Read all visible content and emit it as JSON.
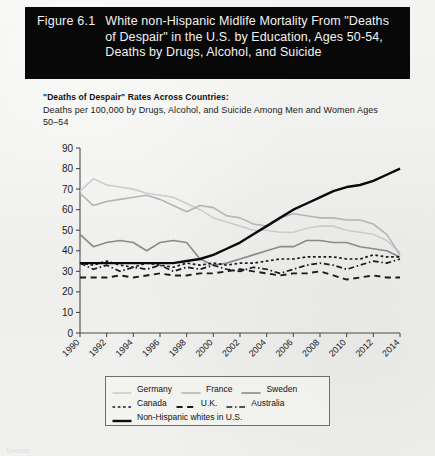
{
  "figure": {
    "number": "Figure 6.1",
    "title": "White non-Hispanic Midlife Mortality From \"Deaths of Despair\" in the U.S. by Education, Ages 50-54, Deaths by Drugs, Alcohol, and Suicide"
  },
  "footer": {
    "note": "Source:"
  },
  "colors": {
    "banner_bg": "#080808",
    "banner_text": "#f2f2f2",
    "page_bg": "#f1f1ef",
    "germany": "#cccccc",
    "france": "#b4b4b4",
    "sweden": "#8a8a8a",
    "canada": "#1a1a1a",
    "uk": "#1a1a1a",
    "australia": "#1a1a1a",
    "us_whites": "#0a0a0a",
    "axis": "#4a4a4a",
    "legend_border": "#6e6e6e"
  },
  "chart_data": {
    "type": "line",
    "title": "\"Deaths of Despair\" Rates Across Countries:",
    "subtitle": "Deaths per 100,000 by Drugs, Alcohol, and Suicide Among Men and Women Ages 50–54",
    "xlabel": "",
    "ylabel": "",
    "xlim": [
      1990,
      2014
    ],
    "ylim": [
      0,
      90
    ],
    "grid": false,
    "legend_position": "bottom",
    "x": [
      1990,
      1991,
      1992,
      1993,
      1994,
      1995,
      1996,
      1997,
      1998,
      1999,
      2000,
      2001,
      2002,
      2003,
      2004,
      2005,
      2006,
      2007,
      2008,
      2009,
      2010,
      2011,
      2012,
      2013,
      2014
    ],
    "xticks": [
      "1990",
      "1992",
      "1994",
      "1996",
      "1998",
      "2000",
      "2002",
      "2004",
      "2006",
      "2008",
      "2010",
      "2012",
      "2014"
    ],
    "yticks": [
      "0",
      "10",
      "20",
      "30",
      "40",
      "50",
      "60",
      "70",
      "80",
      "90"
    ],
    "series": [
      {
        "name": "Germany",
        "style": "solid",
        "color": "#cccccc",
        "width": 1.6,
        "values": [
          69,
          75,
          72,
          71,
          70,
          68,
          67,
          66,
          63,
          60,
          56,
          54,
          52,
          50,
          50,
          49,
          49,
          51,
          52,
          52,
          50,
          49,
          48,
          45,
          39
        ]
      },
      {
        "name": "France",
        "style": "solid",
        "color": "#b4b4b4",
        "width": 1.6,
        "values": [
          68,
          62,
          64,
          65,
          66,
          67,
          65,
          62,
          59,
          62,
          61,
          57,
          56,
          53,
          52,
          56,
          58,
          57,
          56,
          56,
          55,
          55,
          53,
          48,
          38
        ]
      },
      {
        "name": "Sweden",
        "style": "solid",
        "color": "#8a8a8a",
        "width": 1.6,
        "values": [
          48,
          42,
          44,
          45,
          44,
          40,
          44,
          45,
          44,
          36,
          33,
          34,
          36,
          38,
          40,
          42,
          42,
          45,
          45,
          44,
          44,
          42,
          41,
          40,
          37
        ]
      },
      {
        "name": "Canada",
        "style": "dotted",
        "color": "#1a1a1a",
        "width": 1.7,
        "values": [
          34,
          33,
          35,
          33,
          32,
          34,
          33,
          32,
          34,
          33,
          34,
          33,
          34,
          34,
          35,
          36,
          36,
          37,
          37,
          37,
          36,
          36,
          38,
          37,
          37
        ]
      },
      {
        "name": "U.K.",
        "style": "dashed",
        "color": "#1a1a1a",
        "width": 1.9,
        "values": [
          27,
          27,
          27,
          28,
          27,
          28,
          29,
          28,
          28,
          29,
          29,
          30,
          31,
          30,
          29,
          28,
          29,
          29,
          30,
          28,
          26,
          27,
          28,
          27,
          27
        ]
      },
      {
        "name": "Australia",
        "style": "dashdot",
        "color": "#1a1a1a",
        "width": 1.7,
        "values": [
          34,
          31,
          33,
          30,
          32,
          31,
          33,
          30,
          32,
          31,
          33,
          31,
          30,
          32,
          31,
          29,
          31,
          33,
          34,
          33,
          31,
          33,
          35,
          34,
          36
        ]
      },
      {
        "name": "Non-Hispanic whites in U.S.",
        "style": "solid",
        "color": "#0a0a0a",
        "width": 2.4,
        "values": [
          34,
          34,
          34,
          34,
          34,
          34,
          34,
          34,
          35,
          36,
          38,
          41,
          44,
          48,
          52,
          56,
          60,
          63,
          66,
          69,
          71,
          72,
          74,
          77,
          80
        ]
      }
    ]
  },
  "legend": {
    "rows": [
      [
        {
          "label": "Germany",
          "series": "Germany"
        },
        {
          "label": "France",
          "series": "France"
        },
        {
          "label": "Sweden",
          "series": "Sweden"
        }
      ],
      [
        {
          "label": "Canada",
          "series": "Canada"
        },
        {
          "label": "U.K.",
          "series": "U.K."
        },
        {
          "label": "Australia",
          "series": "Australia"
        }
      ],
      [
        {
          "label": "Non-Hispanic whites in U.S.",
          "series": "Non-Hispanic whites in U.S."
        }
      ]
    ]
  }
}
